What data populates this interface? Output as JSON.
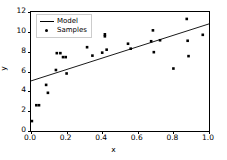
{
  "chart_data": {
    "type": "scatter",
    "title": "",
    "xlabel": "x",
    "ylabel": "y",
    "xlim": [
      0.0,
      1.0
    ],
    "ylim": [
      0.0,
      12.0
    ],
    "grid": false,
    "legend_position": "upper left",
    "x_ticks": [
      "0.0",
      "0.2",
      "0.4",
      "0.6",
      "0.8",
      "1.0"
    ],
    "x_tick_values": [
      0.0,
      0.2,
      0.4,
      0.6,
      0.8,
      1.0
    ],
    "y_ticks": [
      "0",
      "2",
      "4",
      "6",
      "8",
      "10",
      "12"
    ],
    "y_tick_values": [
      0,
      2,
      4,
      6,
      8,
      10,
      12
    ],
    "series": [
      {
        "name": "Model",
        "type": "line",
        "color": "#000000",
        "x": [
          0.0,
          1.0
        ],
        "y": [
          5.05,
          10.8
        ]
      },
      {
        "name": "Samples",
        "type": "scatter",
        "color": "#000000",
        "marker": "square",
        "points": [
          [
            0.005,
            1.0
          ],
          [
            0.03,
            2.6
          ],
          [
            0.045,
            2.6
          ],
          [
            0.085,
            4.65
          ],
          [
            0.095,
            3.85
          ],
          [
            0.14,
            6.15
          ],
          [
            0.145,
            7.85
          ],
          [
            0.165,
            7.85
          ],
          [
            0.18,
            7.45
          ],
          [
            0.195,
            7.45
          ],
          [
            0.2,
            5.8
          ],
          [
            0.3,
            9.75
          ],
          [
            0.315,
            8.45
          ],
          [
            0.345,
            7.6
          ],
          [
            0.4,
            7.9
          ],
          [
            0.415,
            9.75
          ],
          [
            0.415,
            9.55
          ],
          [
            0.425,
            8.2
          ],
          [
            0.545,
            8.8
          ],
          [
            0.56,
            8.3
          ],
          [
            0.675,
            9.05
          ],
          [
            0.685,
            10.15
          ],
          [
            0.69,
            7.95
          ],
          [
            0.725,
            9.15
          ],
          [
            0.8,
            6.3
          ],
          [
            0.875,
            11.3
          ],
          [
            0.88,
            9.1
          ],
          [
            0.885,
            7.55
          ],
          [
            0.965,
            9.7
          ]
        ]
      }
    ]
  },
  "legend": {
    "entries": [
      {
        "label": "Model"
      },
      {
        "label": "Samples"
      }
    ]
  }
}
